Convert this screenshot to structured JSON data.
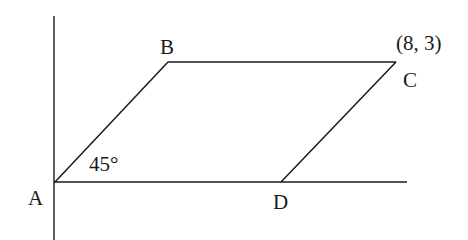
{
  "diagram": {
    "type": "geometry-parallelogram",
    "colors": {
      "stroke": "#1a1a1a",
      "background": "#ffffff"
    },
    "axes": {
      "vertical": {
        "x": 54,
        "y1": 16,
        "y2": 240
      },
      "horizontal": {
        "y": 182,
        "x1": 54,
        "x2": 407
      }
    },
    "points": {
      "A": {
        "label": "A",
        "x": 54,
        "y": 182
      },
      "B": {
        "label": "B",
        "x": 168,
        "y": 62
      },
      "C": {
        "label": "C",
        "x": 396,
        "y": 62,
        "coordinate_label": "(8, 3)"
      },
      "D": {
        "label": "D",
        "x": 281,
        "y": 182
      }
    },
    "segments": [
      {
        "from": "A",
        "to": "B"
      },
      {
        "from": "B",
        "to": "C"
      },
      {
        "from": "C",
        "to": "D"
      }
    ],
    "angle": {
      "vertex": "A",
      "label": "45°"
    }
  }
}
